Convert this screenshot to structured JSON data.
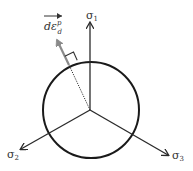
{
  "diagram": {
    "axes": [
      {
        "id": "sigma1",
        "label": "σ",
        "subscript": "1"
      },
      {
        "id": "sigma2",
        "label": "σ",
        "subscript": "2"
      },
      {
        "id": "sigma3",
        "label": "σ",
        "subscript": "3"
      }
    ],
    "vector": {
      "label": "dε",
      "subscript": "d",
      "superscript": "p",
      "color": "#8a8a8a"
    },
    "colors": {
      "axis": "#2a2a2a",
      "circle": "#1a1a1a",
      "vector": "#8a8a8a",
      "text": "#333333"
    }
  }
}
